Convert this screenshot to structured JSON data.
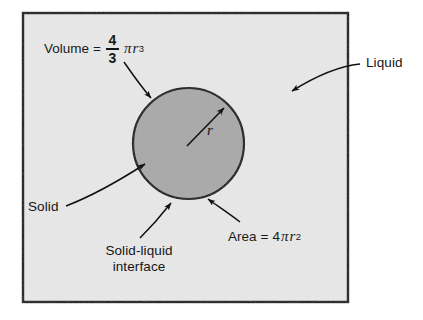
{
  "figure": {
    "panel": {
      "x": 23,
      "y": 13,
      "width": 325,
      "height": 289,
      "fill": "#e8e8e8",
      "border_color": "#111111"
    },
    "sphere": {
      "cx": 188.5,
      "cy": 143.5,
      "r": 55.5,
      "fill": "#a9a9a9",
      "stroke": "#111111"
    },
    "labels": {
      "volume": {
        "prefix": "Volume",
        "equals": "=",
        "numerator": "4",
        "denominator": "3",
        "pi": "π",
        "variable": "r",
        "exponent": "3"
      },
      "area": {
        "prefix": "Area",
        "equals": "=",
        "coefficient": "4",
        "pi": "π",
        "variable": "r",
        "exponent": "2"
      },
      "radius": "r",
      "liquid": "Liquid",
      "solid": "Solid",
      "interface_line1": "Solid-liquid",
      "interface_line2": "interface"
    },
    "colors": {
      "ink": "#151515",
      "panel_fill": "#e8e8e8",
      "sphere_fill": "#a9a9a9",
      "page": "#ffffff"
    }
  }
}
